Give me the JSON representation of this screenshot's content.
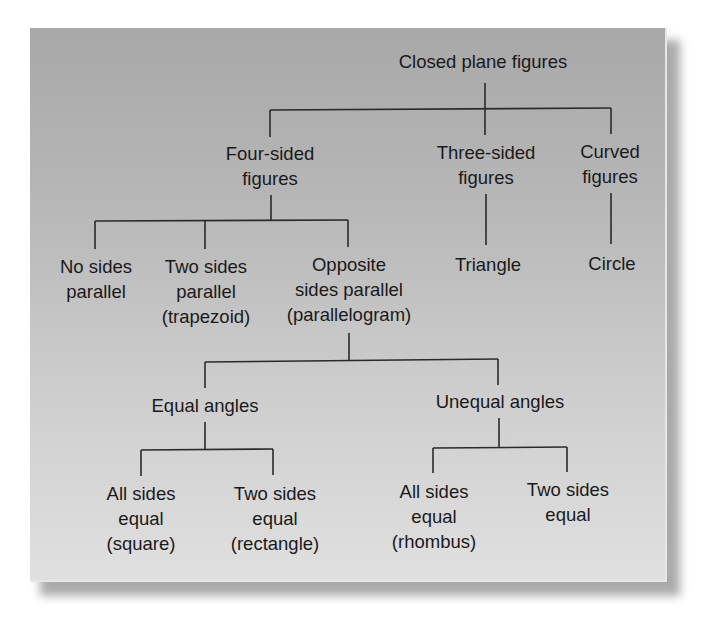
{
  "diagram": {
    "type": "tree",
    "root": {
      "label": "Closed plane figures",
      "children": [
        {
          "label": [
            "Four-sided",
            "figures"
          ],
          "children": [
            {
              "label": [
                "No sides",
                "parallel"
              ]
            },
            {
              "label": [
                "Two sides",
                "parallel",
                "(trapezoid)"
              ]
            },
            {
              "label": [
                "Opposite",
                "sides parallel",
                "(parallelogram)"
              ],
              "children": [
                {
                  "label": [
                    "Equal angles"
                  ],
                  "children": [
                    {
                      "label": [
                        "All sides",
                        "equal",
                        "(square)"
                      ]
                    },
                    {
                      "label": [
                        "Two sides",
                        "equal",
                        "(rectangle)"
                      ]
                    }
                  ]
                },
                {
                  "label": [
                    "Unequal angles"
                  ],
                  "children": [
                    {
                      "label": [
                        "All sides",
                        "equal",
                        "(rhombus)"
                      ]
                    },
                    {
                      "label": [
                        "Two sides",
                        "equal"
                      ]
                    }
                  ]
                }
              ]
            }
          ]
        },
        {
          "label": [
            "Three-sided",
            "figures"
          ],
          "children": [
            {
              "label": [
                "Triangle"
              ]
            }
          ]
        },
        {
          "label": [
            "Curved",
            "figures"
          ],
          "children": [
            {
              "label": [
                "Circle"
              ]
            }
          ]
        }
      ]
    }
  },
  "nodes": {
    "root": "Closed plane figures",
    "four_sided": {
      "l1": "Four-sided",
      "l2": "figures"
    },
    "three_sided": {
      "l1": "Three-sided",
      "l2": "figures"
    },
    "curved": {
      "l1": "Curved",
      "l2": "figures"
    },
    "no_sides_parallel": {
      "l1": "No sides",
      "l2": "parallel"
    },
    "two_sides_parallel": {
      "l1": "Two sides",
      "l2": "parallel",
      "l3": "(trapezoid)"
    },
    "opposite_sides_parallel": {
      "l1": "Opposite",
      "l2": "sides parallel",
      "l3": "(parallelogram)"
    },
    "triangle": "Triangle",
    "circle": "Circle",
    "equal_angles": "Equal angles",
    "unequal_angles": "Unequal angles",
    "square": {
      "l1": "All sides",
      "l2": "equal",
      "l3": "(square)"
    },
    "rectangle": {
      "l1": "Two sides",
      "l2": "equal",
      "l3": "(rectangle)"
    },
    "rhombus": {
      "l1": "All sides",
      "l2": "equal",
      "l3": "(rhombus)"
    },
    "two_sides_equal": {
      "l1": "Two sides",
      "l2": "equal"
    }
  },
  "colors": {
    "panel_top": "#a8a8a8",
    "panel_bottom": "#e0e0e0",
    "line": "#2a2a2a",
    "text": "#1a1a1a"
  }
}
